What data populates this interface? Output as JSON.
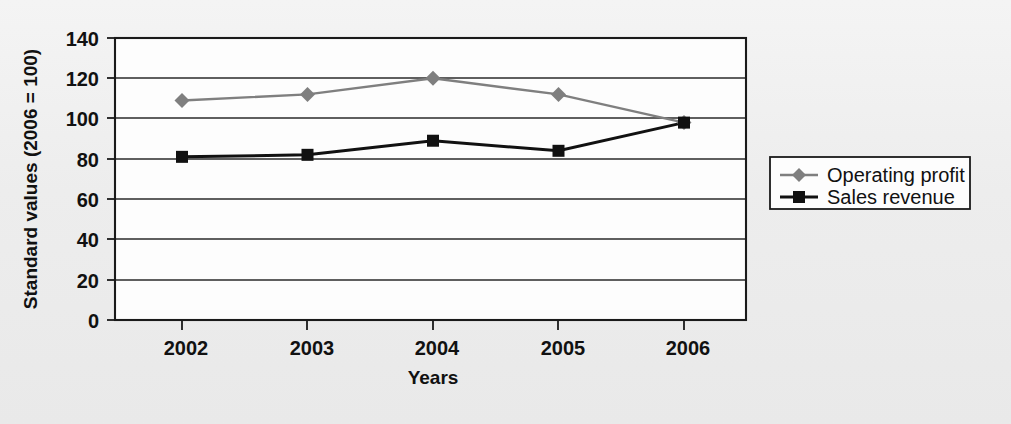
{
  "chart_data": {
    "type": "line",
    "title": "",
    "xlabel": "Years",
    "ylabel": "Standard values (2006 = 100)",
    "categories": [
      "2002",
      "2003",
      "2004",
      "2005",
      "2006"
    ],
    "x": [
      2002,
      2003,
      2004,
      2005,
      2006
    ],
    "ylim": [
      0,
      140
    ],
    "y_ticks": [
      0,
      20,
      40,
      60,
      80,
      100,
      120,
      140
    ],
    "grid": "horizontal",
    "legend_position": "right",
    "series": [
      {
        "name": "Operating profit",
        "values": [
          109,
          112,
          120,
          112,
          98
        ],
        "color": "#7f7f7f",
        "marker": "diamond"
      },
      {
        "name": "Sales revenue",
        "values": [
          81,
          82,
          89,
          84,
          98
        ],
        "color": "#111111",
        "marker": "square"
      }
    ]
  },
  "axes": {
    "y_title": "Standard values (2006 = 100)",
    "x_title": "Years",
    "y_tick_labels": [
      "140",
      "120",
      "100",
      "80",
      "60",
      "40",
      "20",
      "0"
    ],
    "x_tick_labels": [
      "2002",
      "2003",
      "2004",
      "2005",
      "2006"
    ]
  },
  "legend": {
    "entries": [
      {
        "label": "Operating profit",
        "marker": "diamond-marker",
        "color": "#7f7f7f"
      },
      {
        "label": "Sales revenue",
        "marker": "square-marker",
        "color": "#111111"
      }
    ]
  },
  "colors": {
    "page_background": "#efefef",
    "plot_background": "#fdfdfd",
    "frame": "#1a1a1a",
    "grid": "#2a2a2a",
    "operating_profit": "#7f7f7f",
    "sales_revenue": "#111111"
  }
}
